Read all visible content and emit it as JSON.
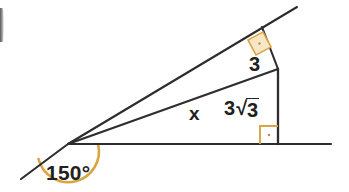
{
  "figure": {
    "type": "geometry-diagram",
    "width": 349,
    "height": 192,
    "background_color": "#ffffff",
    "line_color": "#2e2c2d",
    "text_color": "#231f20",
    "marker_fill_color": "#f7e7c6",
    "marker_stroke_color": "#d9a441",
    "arc_color": "#d9a441"
  },
  "labels": {
    "angle_150": "150°",
    "side_x": "x",
    "side_3": "3",
    "side_3root3_coefficient": "3",
    "radical_sign": "√",
    "radicand": "3",
    "side_3root3_plain": "3√3"
  },
  "geometry": {
    "vertex": {
      "x": 68,
      "y": 144,
      "name": "apex-vertex-left"
    },
    "points": {
      "ray_lower_left_end": {
        "x": 21,
        "y": 179
      },
      "baseline_right_end": {
        "x": 331,
        "y": 144
      },
      "upper_ray_end": {
        "x": 297,
        "y": 7
      },
      "top_apex": {
        "x": 262,
        "y": 27
      },
      "right_upper_corner": {
        "x": 278,
        "y": 69
      },
      "right_lower_corner": {
        "x": 278,
        "y": 144
      }
    },
    "segments": [
      {
        "name": "extension-ray-lower-left",
        "from": "vertex",
        "to": "ray_lower_left_end"
      },
      {
        "name": "baseline-horizontal",
        "from": "vertex",
        "to": "baseline_right_end"
      },
      {
        "name": "upper-hypotenuse-ray",
        "from": "vertex",
        "to": "upper_ray_end"
      },
      {
        "name": "segment-x-middle",
        "from": "vertex",
        "to": "right_upper_corner"
      },
      {
        "name": "segment-3-short-leg",
        "from": "top_apex",
        "to": "right_upper_corner"
      },
      {
        "name": "segment-3root3-vertical",
        "from": "right_upper_corner",
        "to": "right_lower_corner"
      }
    ],
    "right_angle_markers": [
      {
        "name": "right-angle-top",
        "x": 248,
        "y": 40,
        "size": 17,
        "rotation_deg": -28,
        "filled": true
      },
      {
        "name": "right-angle-bottom",
        "x": 260,
        "y": 125,
        "size": 18,
        "rotation_deg": 0,
        "filled": false
      }
    ],
    "angle_arc": {
      "name": "angle-arc-150",
      "center_x": 68,
      "center_y": 144,
      "radius": 30,
      "value_degrees": 150
    }
  }
}
